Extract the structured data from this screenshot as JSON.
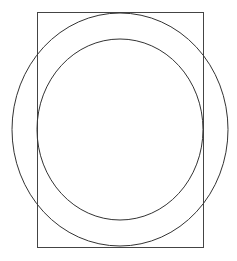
{
  "canvas": {
    "width": 237,
    "height": 261,
    "background": "#ffffff"
  },
  "shapes": {
    "rectangle": {
      "x": 37,
      "y": 12,
      "width": 166,
      "height": 235,
      "stroke": "#444444",
      "stroke_width": 1
    },
    "outer_ellipse": {
      "cx": 120,
      "cy": 129.5,
      "rx": 108,
      "ry": 116.5,
      "stroke": "#333333",
      "stroke_width": 1
    },
    "inner_ellipse": {
      "cx": 120,
      "cy": 129.5,
      "rx": 83,
      "ry": 90.5,
      "stroke": "#333333",
      "stroke_width": 1
    }
  }
}
